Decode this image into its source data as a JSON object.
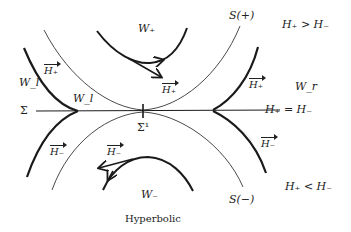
{
  "diagram": {
    "caption": "Hyperbolic",
    "labels": {
      "w_plus": "W₊",
      "w_minus": "W₋",
      "w_l_outer": "W_l",
      "w_l_inner": "W_l",
      "w_r": "W_r",
      "sigma": "Σ",
      "sigma1": "Σ¹",
      "s_plus": "S(+)",
      "s_minus": "S(−)",
      "region_top": "H₊ > H₋",
      "region_mid": "H₊ = H₋",
      "region_bottom": "H₊ < H₋",
      "vec_h_plus_left": "H₊",
      "vec_h_plus_center": "H₊",
      "vec_h_plus_right": "H₊",
      "vec_h_minus_left": "H₋",
      "vec_h_minus_center": "H₋",
      "vec_h_minus_right": "H₋"
    },
    "colors": {
      "stroke": "#1a1a1a",
      "background": "#ffffff"
    }
  }
}
